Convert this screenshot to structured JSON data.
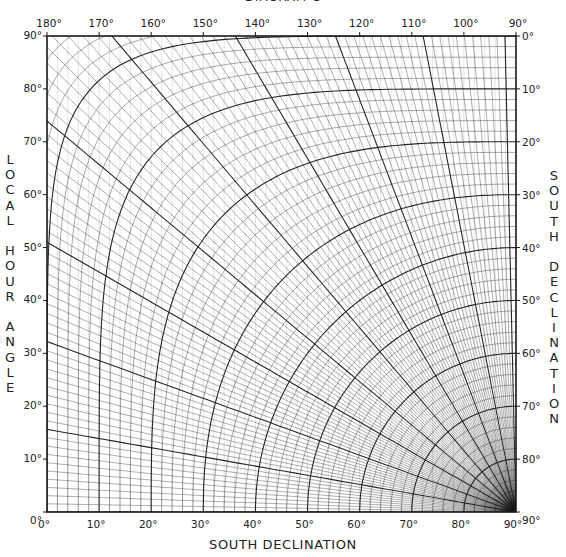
{
  "title": "DIAGRAM C",
  "left_axis_title": [
    "L",
    "O",
    "C",
    "A",
    "L",
    "",
    "H",
    "O",
    "U",
    "R",
    "",
    "A",
    "N",
    "G",
    "L",
    "E"
  ],
  "right_axis_title": [
    "S",
    "O",
    "U",
    "T",
    "H",
    "",
    "D",
    "E",
    "C",
    "L",
    "I",
    "N",
    "A",
    "T",
    "I",
    "O",
    "N"
  ],
  "bottom_axis_title": "SOUTH  DECLINATION",
  "colors": {
    "ink": "#1a1a1a",
    "paper": "#ffffff"
  },
  "chart_data": {
    "type": "diagram",
    "xlabel": "SOUTH DECLINATION",
    "ylabel": "LOCAL HOUR ANGLE",
    "y2label": "SOUTH DECLINATION",
    "top_axis_ticks": [
      "180°",
      "170°",
      "160°",
      "150°",
      "140°",
      "130°",
      "120°",
      "110°",
      "100°",
      "90°"
    ],
    "bottom_axis_ticks": [
      "0°",
      "10°",
      "20°",
      "30°",
      "40°",
      "50°",
      "60°",
      "70°",
      "80°",
      "90°"
    ],
    "left_axis_ticks": [
      "90°",
      "80°",
      "70°",
      "60°",
      "50°",
      "40°",
      "30°",
      "20°",
      "10°",
      "0°"
    ],
    "right_axis_ticks": [
      "0°",
      "10°",
      "20°",
      "30°",
      "40°",
      "50°",
      "60°",
      "70°",
      "80°",
      "90°"
    ],
    "xlim": [
      0,
      90
    ],
    "ylim": [
      0,
      90
    ],
    "top_xlim": [
      180,
      90
    ],
    "right_ylim": [
      90,
      0
    ],
    "families": [
      {
        "name": "declination arcs",
        "center": "bottom-right corner (90°,0°)",
        "major_step": 10,
        "minor_step": 2
      },
      {
        "name": "hour angle curves",
        "from": "left edge horizontal",
        "to": "pole at bottom-right",
        "major_step": 10,
        "minor_step": 1
      }
    ],
    "grid": true
  }
}
